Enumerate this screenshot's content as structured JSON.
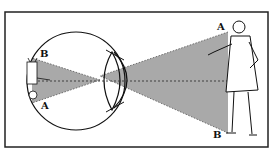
{
  "figure": {
    "labels": {
      "eye_top": "B",
      "eye_bottom": "A",
      "man_top": "A",
      "man_bottom": "B"
    },
    "colors": {
      "background": "#ffffff",
      "line": "#111111",
      "cone_fill": "#a9a9a9",
      "frame": "#222222"
    }
  }
}
